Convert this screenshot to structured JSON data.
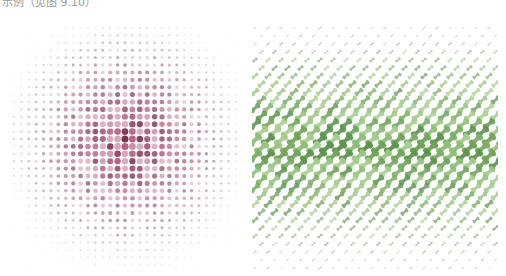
{
  "caption": "示例（见图 9.10）",
  "figures": [
    {
      "id": "halftone-dots",
      "description": "Radial halftone dot pattern, dots largest and darkest at center",
      "shape": "circle",
      "colors": [
        "#8e3a5c",
        "#b45c80",
        "#c98aa3",
        "#a9476c",
        "#d3a3b7",
        "#7a2e4f"
      ],
      "center_color": "#8a3358",
      "grid": {
        "cols": 31,
        "rows": 33,
        "spacing_x": 7.4,
        "spacing_y": 7.4
      }
    },
    {
      "id": "bone-tiles",
      "description": "Diagonal dog-bone tile pattern, tiles largest in horizontal center band",
      "shape": "bone",
      "colors": [
        "#6fa45a",
        "#8ebf78",
        "#a6cd8e",
        "#5e9550",
        "#9cc585",
        "#7cae66"
      ],
      "grid": {
        "cols": 19,
        "rows": 31,
        "spacing_x": 13,
        "spacing_y": 8
      }
    }
  ]
}
